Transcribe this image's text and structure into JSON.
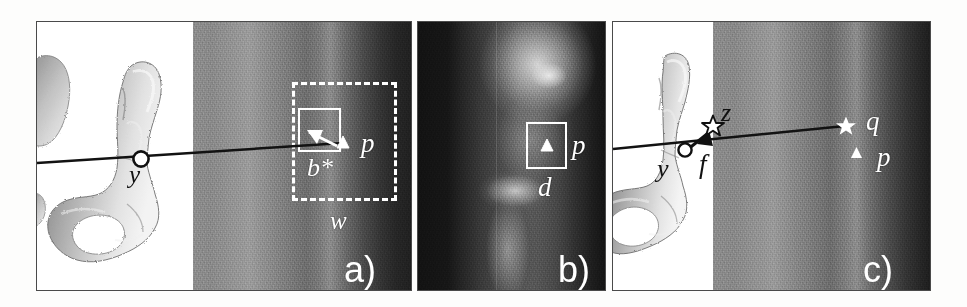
{
  "figure": {
    "background_color": "#fdfdfc",
    "panels": [
      {
        "tag": "a)",
        "description": "3D bone surface render fused with fluoroscopic image, showing search window w, candidate block b*, projected point p and 3D landmark y",
        "labels": {
          "y": "y",
          "p": "p",
          "b_star": "b*",
          "w": "w"
        }
      },
      {
        "tag": "b)",
        "description": "Fluoroscopic hip radiograph with detection block d around projected point p",
        "labels": {
          "p": "p",
          "d": "d"
        }
      },
      {
        "tag": "c)",
        "description": "3D bone surface render fused with fluoroscopic image showing correspondence q, displacement f and updated landmark z",
        "labels": {
          "y": "y",
          "z": "z",
          "f": "f",
          "q": "q",
          "p": "p"
        }
      }
    ]
  },
  "colors": {
    "white": "#ffffff",
    "dark_line": "#121212",
    "panel_border": "#4a4a4a",
    "page_background": "#fdfdfc"
  },
  "icons": {
    "circle_marker": "open-circle-marker",
    "triangle_marker": "filled-triangle-marker",
    "star_outline": "outline-star-marker",
    "star_filled": "filled-star-marker",
    "arrow": "arrow-icon"
  }
}
